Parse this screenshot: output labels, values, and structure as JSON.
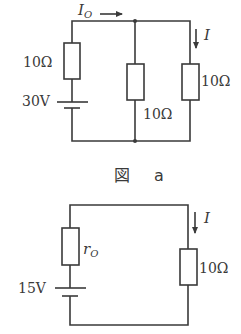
{
  "figure_a": {
    "caption_kanji": "図",
    "caption_letter": "a",
    "current_main": "I",
    "current_main_sub": "O",
    "current_branch": "I",
    "source_resistor": "10Ω",
    "source_voltage": "30V",
    "middle_resistor": "10Ω",
    "right_resistor": "10Ω"
  },
  "figure_b": {
    "internal_resistor_symbol": "r",
    "internal_resistor_sub": "O",
    "source_voltage": "15V",
    "load_resistor": "10Ω",
    "current": "I"
  }
}
